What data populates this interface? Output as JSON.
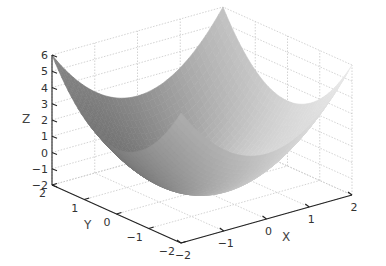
{
  "chart_data": {
    "type": "surface",
    "title": "",
    "function": "z = x^2 + y^2 - 2",
    "xlabel": "X",
    "ylabel": "Y",
    "zlabel": "Z",
    "xlim": [
      -2,
      2
    ],
    "ylim": [
      -2,
      2
    ],
    "zlim": [
      -2,
      6
    ],
    "x_ticks": [
      "-2",
      "-1",
      "0",
      "1",
      "2"
    ],
    "y_ticks": [
      "-2",
      "-1",
      "0",
      "1",
      "2"
    ],
    "z_ticks": [
      "-2",
      "-1",
      "0",
      "1",
      "2",
      "3",
      "4",
      "5",
      "6"
    ],
    "grid": true,
    "colormap": "gray",
    "shading": "interp",
    "colorbar": false,
    "legend": false
  },
  "colors": {
    "background": "#ffffff",
    "axis": "#222222",
    "grid": "#c8c8c8",
    "text": "#333333"
  }
}
